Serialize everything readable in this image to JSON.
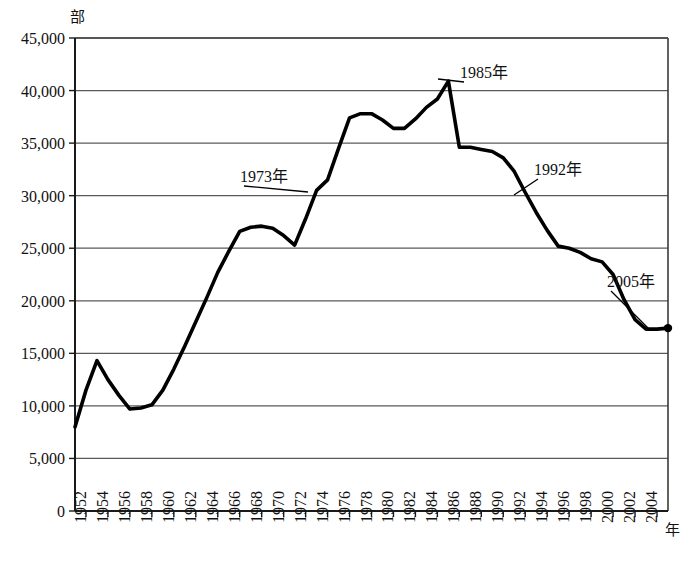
{
  "chart_data": {
    "type": "line",
    "title": "",
    "xlabel": "年",
    "ylabel": "部",
    "unit_label": "部",
    "xaxis_unit": "年",
    "xlim": [
      1951,
      2005
    ],
    "ylim": [
      0,
      45000
    ],
    "ytick_step": 5000,
    "xtick_step": 2,
    "grid": true,
    "legend": false,
    "y_ticks": [
      "0",
      "5,000",
      "10,000",
      "15,000",
      "20,000",
      "25,000",
      "30,000",
      "35,000",
      "40,000",
      "45,000"
    ],
    "y_tick_values": [
      0,
      5000,
      10000,
      15000,
      20000,
      25000,
      30000,
      35000,
      40000,
      45000
    ],
    "x_ticks": [
      "1952",
      "1954",
      "1956",
      "1958",
      "1960",
      "1962",
      "1964",
      "1966",
      "1968",
      "1970",
      "1972",
      "1974",
      "1976",
      "1978",
      "1980",
      "1982",
      "1984",
      "1986",
      "1988",
      "1990",
      "1992",
      "1994",
      "1996",
      "1998",
      "2000",
      "2002",
      "2004"
    ],
    "x_tick_values": [
      1952,
      1954,
      1956,
      1958,
      1960,
      1962,
      1964,
      1966,
      1968,
      1970,
      1972,
      1974,
      1976,
      1978,
      1980,
      1982,
      1984,
      1986,
      1988,
      1990,
      1992,
      1994,
      1996,
      1998,
      2000,
      2002,
      2004
    ],
    "x": [
      1951,
      1952,
      1953,
      1954,
      1955,
      1956,
      1957,
      1958,
      1959,
      1960,
      1961,
      1962,
      1963,
      1964,
      1965,
      1966,
      1967,
      1968,
      1969,
      1970,
      1971,
      1972,
      1973,
      1974,
      1975,
      1976,
      1977,
      1978,
      1979,
      1980,
      1981,
      1982,
      1983,
      1984,
      1985,
      1986,
      1987,
      1988,
      1989,
      1990,
      1991,
      1992,
      1993,
      1994,
      1995,
      1996,
      1997,
      1998,
      1999,
      2000,
      2001,
      2002,
      2003,
      2004,
      2005
    ],
    "values": [
      8000,
      11500,
      14300,
      12500,
      11000,
      9700,
      9800,
      10100,
      11500,
      13500,
      15700,
      18000,
      20300,
      22700,
      24700,
      26600,
      27000,
      27100,
      26900,
      26200,
      25300,
      27800,
      30500,
      31500,
      34500,
      37400,
      37800,
      37800,
      37200,
      36400,
      36400,
      37300,
      38400,
      39200,
      40900,
      34600,
      34600,
      34400,
      34200,
      33600,
      32300,
      30300,
      28400,
      26700,
      25200,
      25000,
      24600,
      24000,
      23700,
      22500,
      20100,
      18200,
      17300,
      17300,
      17400
    ],
    "series": [
      {
        "name": "発行部数",
        "values": [
          8000,
          11500,
          14300,
          12500,
          11000,
          9700,
          9800,
          10100,
          11500,
          13500,
          15700,
          18000,
          20300,
          22700,
          24700,
          26600,
          27000,
          27100,
          26900,
          26200,
          25300,
          27800,
          30500,
          31500,
          34500,
          37400,
          37800,
          37800,
          37200,
          36400,
          36400,
          37300,
          38400,
          39200,
          40900,
          34600,
          34600,
          34400,
          34200,
          33600,
          32300,
          30300,
          28400,
          26700,
          25200,
          25000,
          24600,
          24000,
          23700,
          22500,
          20100,
          18200,
          17300,
          17300,
          17400
        ]
      }
    ],
    "annotations": [
      {
        "label": "1973年",
        "year": 1973,
        "value": 30500,
        "label_x": 240,
        "label_y": 182,
        "anchor_x": 308,
        "anchor_y": 192
      },
      {
        "label": "1985年",
        "year": 1985,
        "value": 40900,
        "label_x": 460,
        "label_y": 78,
        "anchor_x": 438,
        "anchor_y": 79
      },
      {
        "label": "1992年",
        "year": 1992,
        "value": 30300,
        "label_x": 534,
        "label_y": 175,
        "anchor_x": 514,
        "anchor_y": 195
      },
      {
        "label": "2005年",
        "year": 2005,
        "value": 17400,
        "label_x": 607,
        "label_y": 287,
        "anchor_x": 649,
        "anchor_y": 329
      }
    ],
    "marked_points": [
      {
        "year": 2005,
        "value": 17400
      }
    ],
    "colors": {
      "line": "#000000",
      "grid": "#5a5a58",
      "axis": "#1a1a1a",
      "background": "#ffffff"
    }
  }
}
